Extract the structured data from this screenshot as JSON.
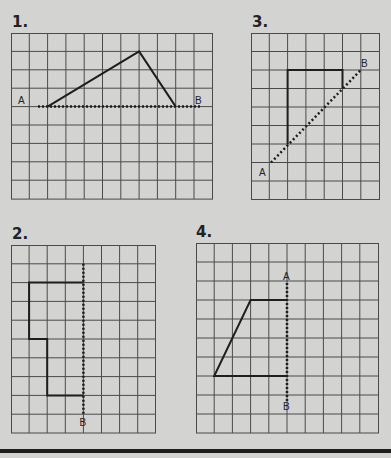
{
  "problems": [
    {
      "number": "1.",
      "grid": {
        "cols": 11,
        "rows": 9
      },
      "shape": [
        [
          2,
          4
        ],
        [
          7,
          1
        ],
        [
          9,
          4
        ]
      ],
      "mirror_line": {
        "from": [
          1,
          4
        ],
        "to": [
          10,
          4
        ],
        "label_a": "A",
        "label_b": "B"
      }
    },
    {
      "number": "2.",
      "grid": {
        "cols": 8,
        "rows": 10
      },
      "shape": [
        [
          4,
          2
        ],
        [
          1,
          2
        ],
        [
          1,
          5
        ],
        [
          2,
          5
        ],
        [
          2,
          8
        ],
        [
          4,
          8
        ]
      ],
      "mirror_line": {
        "from": [
          4,
          1
        ],
        "to": [
          4,
          9.3
        ],
        "label_b": "B"
      }
    },
    {
      "number": "3.",
      "grid": {
        "cols": 7,
        "rows": 9
      },
      "shape": [
        [
          2,
          6
        ],
        [
          2,
          2
        ],
        [
          5,
          2
        ],
        [
          5,
          3
        ]
      ],
      "mirror_line": {
        "from": [
          1,
          7
        ],
        "to": [
          6,
          2
        ],
        "label_a": "A",
        "label_b": "B"
      }
    },
    {
      "number": "4.",
      "grid": {
        "cols": 10,
        "rows": 10
      },
      "shape": [
        [
          5,
          3
        ],
        [
          3,
          3
        ],
        [
          1,
          7
        ],
        [
          5,
          7
        ]
      ],
      "mirror_line": {
        "from": [
          5,
          2
        ],
        "to": [
          5,
          8.5
        ],
        "label_a": "A",
        "label_b": "B"
      }
    }
  ],
  "colors": {
    "background": "#d3d3d1",
    "grid_line": "#4a4a4a",
    "shape_line": "#1e1e1e"
  }
}
